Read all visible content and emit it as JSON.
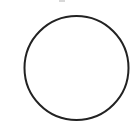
{
  "figure": {
    "shape": "circle",
    "stroke_color": "#222222",
    "fill_color": "none",
    "background_color": "#ffffff",
    "center_x": 76.5,
    "center_y": 68,
    "radius": 52,
    "stroke_width": 2
  }
}
